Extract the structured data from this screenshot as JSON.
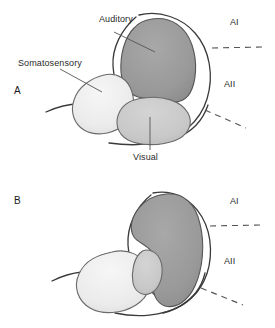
{
  "figure": {
    "panels": [
      {
        "id": "A",
        "label": "A",
        "regions": [
          {
            "name": "Auditory",
            "label": "Auditory",
            "fill": "#9a9a9a"
          },
          {
            "name": "Somatosensory",
            "label": "Somatosensory",
            "fill": "#ececec"
          },
          {
            "name": "Visual",
            "label": "Visual",
            "fill": "#c9c9c9"
          }
        ],
        "area_labels": [
          {
            "name": "AI",
            "label": "AI"
          },
          {
            "name": "AII",
            "label": "AII"
          }
        ]
      },
      {
        "id": "B",
        "label": "B",
        "regions": [
          {
            "name": "Auditory",
            "label": "",
            "fill": "#9a9a9a"
          },
          {
            "name": "Somatosensory",
            "label": "",
            "fill": "#ececec"
          },
          {
            "name": "Visual",
            "label": "",
            "fill": "#c9c9c9"
          }
        ],
        "area_labels": [
          {
            "name": "AI",
            "label": "AI"
          },
          {
            "name": "AII",
            "label": "AII"
          }
        ]
      }
    ],
    "colors": {
      "auditory_fill": "#9a9a9a",
      "somatosensory_fill": "#ececec",
      "visual_fill": "#c9c9c9",
      "outline": "#3a3a3a",
      "leader": "#555555",
      "dashed": "#555555",
      "background": "#ffffff"
    }
  }
}
